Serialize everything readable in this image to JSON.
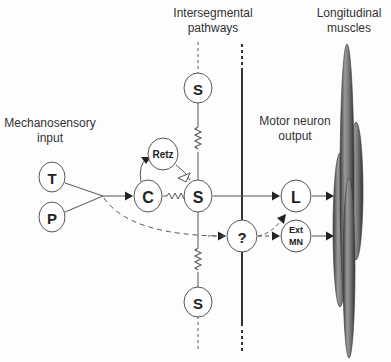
{
  "labels": {
    "intersegmental": [
      "Intersegmental",
      "pathways"
    ],
    "longitudinal": [
      "Longitudinal",
      "muscles"
    ],
    "mechanosensory": [
      "Mechanosensory",
      "input"
    ],
    "motor": [
      "Motor neuron",
      "output"
    ]
  },
  "nodes": {
    "t": "T",
    "p": "P",
    "c": "C",
    "retz": "Retz",
    "s_top": "S",
    "s_mid": "S",
    "s_bottom": "S",
    "unknown": "?",
    "l": "L",
    "ext_mn_1": "Ext",
    "ext_mn_2": "MN"
  },
  "colors": {
    "line": "#444444",
    "node_stroke": "#555555",
    "node_fill": "#ffffff",
    "muscle_fill": "#7a7a7a",
    "muscle_edge": "#3a3a3a"
  }
}
